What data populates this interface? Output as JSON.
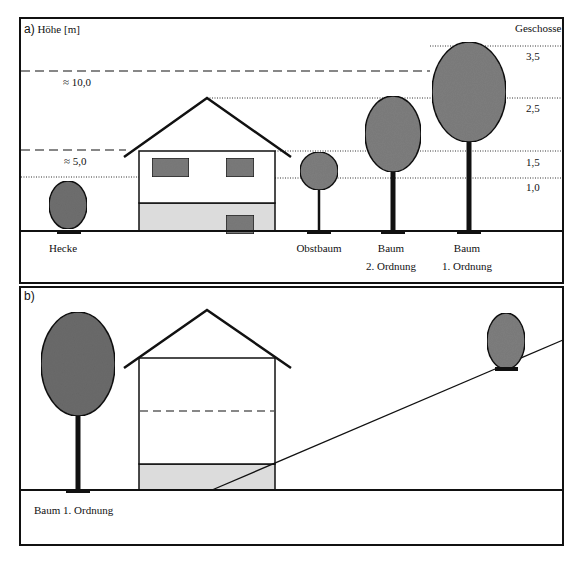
{
  "panel_a": {
    "label": "a)",
    "axis_title": "Höhe [m]",
    "right_title": "Geschosse",
    "height_marks": [
      {
        "label": "≈ 10,0"
      },
      {
        "label": "≈ 5,0"
      }
    ],
    "storey_marks": [
      "3,5",
      "2,5",
      "1,5",
      "1,0"
    ],
    "objects": [
      {
        "name": "Hecke",
        "label_line1": "Hecke",
        "label_line2": ""
      },
      {
        "name": "Obstbaum",
        "label_line1": "Obstbaum",
        "label_line2": ""
      },
      {
        "name": "Baum 2. Ordnung",
        "label_line1": "Baum",
        "label_line2": "2. Ordnung"
      },
      {
        "name": "Baum 1. Ordnung",
        "label_line1": "Baum",
        "label_line2": "1. Ordnung"
      }
    ]
  },
  "panel_b": {
    "label": "b)",
    "caption": "Baum 1. Ordnung"
  },
  "colors": {
    "foliage": "#7d7d7d",
    "basement": "#dcdcdc",
    "window": "#7a7a7a",
    "line": "#111111"
  }
}
